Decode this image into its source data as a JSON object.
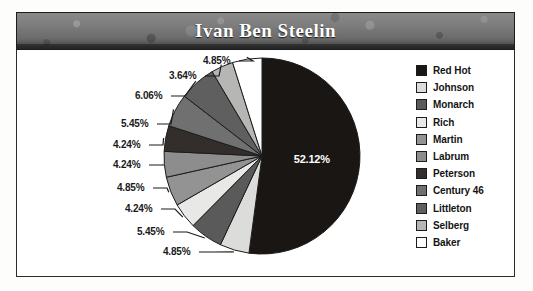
{
  "window": {
    "title": "Ivan Ben Steelin"
  },
  "legend": {
    "position": "right",
    "items": [
      {
        "label": "Red Hot",
        "color": "#1a1614"
      },
      {
        "label": "Johnson",
        "color": "#dcdcda"
      },
      {
        "label": "Monarch",
        "color": "#5a5a5a"
      },
      {
        "label": "Rich",
        "color": "#e8e8e6"
      },
      {
        "label": "Martin",
        "color": "#939393"
      },
      {
        "label": "Labrum",
        "color": "#8d8d8d"
      },
      {
        "label": "Peterson",
        "color": "#332e2c"
      },
      {
        "label": "Century 46",
        "color": "#707070"
      },
      {
        "label": "Littleton",
        "color": "#5f5f5f"
      },
      {
        "label": "Selberg",
        "color": "#b6b6b4"
      },
      {
        "label": "Baker",
        "color": "#ffffff"
      }
    ]
  },
  "chart_data": {
    "type": "pie",
    "title": "Ivan Ben Steelin",
    "labels": [
      "Red Hot",
      "Johnson",
      "Monarch",
      "Rich",
      "Martin",
      "Labrum",
      "Peterson",
      "Century 46",
      "Littleton",
      "Selberg",
      "Baker"
    ],
    "values": [
      52.12,
      4.85,
      5.45,
      4.24,
      4.85,
      4.24,
      4.24,
      5.45,
      6.06,
      3.64,
      4.85
    ],
    "value_labels": [
      "52.12%",
      "4.85%",
      "5.45%",
      "4.24%",
      "4.85%",
      "4.24%",
      "4.24%",
      "5.45%",
      "6.06%",
      "3.64%",
      "4.85%"
    ],
    "colors": [
      "#1a1614",
      "#dcdcda",
      "#5a5a5a",
      "#e8e8e6",
      "#939393",
      "#8d8d8d",
      "#332e2c",
      "#707070",
      "#5f5f5f",
      "#b6b6b4",
      "#ffffff"
    ],
    "units": "percent",
    "start_angle_deg": 0,
    "direction": "clockwise",
    "legend": "right",
    "grid": false,
    "label_placement": [
      "inside",
      "outside",
      "outside",
      "outside",
      "outside",
      "outside",
      "outside",
      "outside",
      "outside",
      "outside",
      "outside"
    ]
  }
}
